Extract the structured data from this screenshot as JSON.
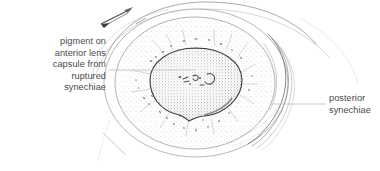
{
  "figure": {
    "type": "medical-illustration",
    "background_color": "#ffffff",
    "ink_color": "#555555",
    "text_color": "#4a4a4a"
  },
  "labels": {
    "left": {
      "name": "pigment-on-anterior-lens-capsule-label",
      "lines": [
        "pigment on",
        "anterior lens",
        "capsule from",
        "ruptured",
        "synechiae"
      ],
      "text": "pigment on\nanterior lens\ncapsule from\nruptured\nsynechiae",
      "align": "right"
    },
    "right": {
      "name": "posterior-synechiae-label",
      "lines": [
        "posterior",
        "synechiae"
      ],
      "text": "posterior\nsynechiae",
      "align": "left"
    }
  },
  "leader_lines": [
    {
      "name": "left-leader-line",
      "x1": 108,
      "y1": 70,
      "x2": 196,
      "y2": 70
    },
    {
      "name": "right-leader-line",
      "x1": 270,
      "y1": 104,
      "x2": 326,
      "y2": 104
    }
  ],
  "structures": [
    {
      "name": "outer-sclera-arc-upper",
      "kind": "arc"
    },
    {
      "name": "outer-sclera-arc-lower",
      "kind": "arc"
    },
    {
      "name": "limbus-circle",
      "kind": "ellipse"
    },
    {
      "name": "iris-ring",
      "kind": "ellipse",
      "texture": "light-stipple"
    },
    {
      "name": "pupil-disc",
      "kind": "ellipse",
      "texture": "dense-stipple"
    },
    {
      "name": "pupil-notch",
      "kind": "path"
    },
    {
      "name": "pigment-marks",
      "kind": "marks"
    },
    {
      "name": "posterior-synechiae-crescents",
      "kind": "arcs"
    },
    {
      "name": "instrument-arrow",
      "kind": "arrow"
    },
    {
      "name": "eyelid-margin-line",
      "kind": "line"
    }
  ]
}
